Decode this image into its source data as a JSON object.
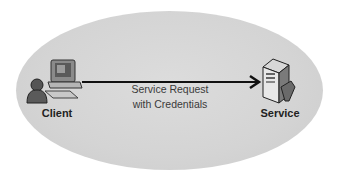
{
  "diagram": {
    "background_color": "#ffffff",
    "ellipse_color": "#d6d6d6",
    "nodes": [
      {
        "id": "client",
        "label": "Client",
        "icon": "client-computer-user-icon"
      },
      {
        "id": "service",
        "label": "Service",
        "icon": "server-icon"
      }
    ],
    "edge": {
      "from": "client",
      "to": "service",
      "label_line1": "Service Request",
      "label_line2": "with Credentials",
      "color": "#111111"
    }
  }
}
